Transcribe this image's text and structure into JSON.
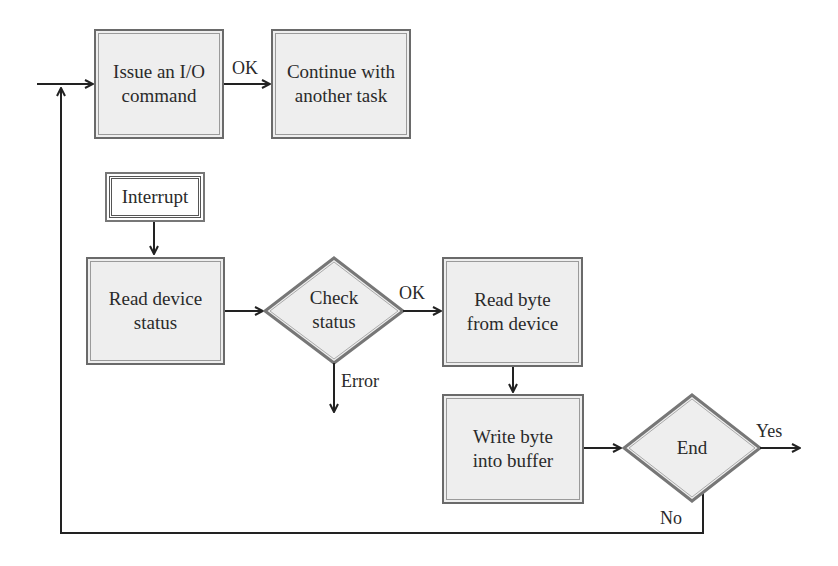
{
  "diagram": {
    "colors": {
      "box_fill": "#eeeeee",
      "border": "#6a6a6a",
      "line": "#222222",
      "text": "#2a2a2a"
    },
    "nodes": {
      "issue_io": {
        "label_l1": "Issue an I/O",
        "label_l2": "command",
        "shape": "rectangle"
      },
      "continue_task": {
        "label_l1": "Continue with",
        "label_l2": "another task",
        "shape": "rectangle"
      },
      "interrupt": {
        "label": "Interrupt",
        "shape": "double-border-rectangle"
      },
      "read_status": {
        "label_l1": "Read device",
        "label_l2": "status",
        "shape": "rectangle"
      },
      "check_status": {
        "label_l1": "Check",
        "label_l2": "status",
        "shape": "diamond"
      },
      "read_byte": {
        "label_l1": "Read byte",
        "label_l2": "from device",
        "shape": "rectangle"
      },
      "write_byte": {
        "label_l1": "Write byte",
        "label_l2": "into buffer",
        "shape": "rectangle"
      },
      "end": {
        "label": "End",
        "shape": "diamond"
      }
    },
    "edge_labels": {
      "issue_to_continue": "OK",
      "check_to_read_byte": "OK",
      "check_error": "Error",
      "end_yes": "Yes",
      "end_no": "No"
    }
  }
}
